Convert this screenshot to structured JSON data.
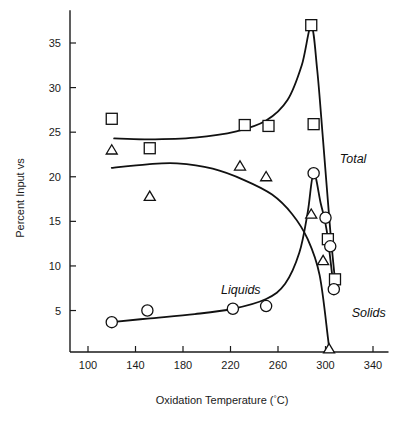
{
  "chart_data": {
    "type": "scatter",
    "title": "",
    "xlabel": "Oxidation Temperature (°C)",
    "ylabel": "Percent Input vs",
    "xlim": [
      88,
      348
    ],
    "ylim": [
      0,
      38
    ],
    "xticks": [
      100,
      140,
      180,
      220,
      260,
      300,
      340
    ],
    "yticks": [
      5,
      10,
      15,
      20,
      25,
      30,
      35
    ],
    "xtick_labels": [
      "100",
      "140",
      "180",
      "220",
      "260",
      "300",
      "340"
    ],
    "ytick_labels": [
      "5",
      "10",
      "15",
      "20",
      "25",
      "30",
      "35"
    ],
    "grid": false,
    "legend_position": "inline-annotations",
    "series": [
      {
        "name": "Total",
        "marker": "square",
        "label": "Total",
        "label_x": 312,
        "label_y": 21.5,
        "points": [
          {
            "x": 120,
            "y": 26.5
          },
          {
            "x": 152,
            "y": 23.2
          },
          {
            "x": 232,
            "y": 25.8
          },
          {
            "x": 252,
            "y": 25.7
          },
          {
            "x": 288,
            "y": 37.0
          },
          {
            "x": 290,
            "y": 25.9
          },
          {
            "x": 302,
            "y": 13.0
          },
          {
            "x": 308,
            "y": 8.5
          }
        ],
        "curve": [
          {
            "x": 122,
            "y": 24.3
          },
          {
            "x": 150,
            "y": 24.2
          },
          {
            "x": 190,
            "y": 24.4
          },
          {
            "x": 225,
            "y": 25.1
          },
          {
            "x": 250,
            "y": 26.3
          },
          {
            "x": 268,
            "y": 28.6
          },
          {
            "x": 280,
            "y": 32.5
          },
          {
            "x": 288,
            "y": 36.9
          },
          {
            "x": 293,
            "y": 32.0
          },
          {
            "x": 298,
            "y": 24.0
          },
          {
            "x": 304,
            "y": 14.0
          },
          {
            "x": 308,
            "y": 8.4
          }
        ]
      },
      {
        "name": "Liquids",
        "marker": "circle",
        "label": "Liquids",
        "label_x": 212,
        "label_y": 6.9,
        "points": [
          {
            "x": 120,
            "y": 3.7
          },
          {
            "x": 150,
            "y": 5.0
          },
          {
            "x": 222,
            "y": 5.2
          },
          {
            "x": 250,
            "y": 5.5
          },
          {
            "x": 290,
            "y": 20.4
          },
          {
            "x": 300,
            "y": 15.4
          },
          {
            "x": 304,
            "y": 12.2
          },
          {
            "x": 307,
            "y": 7.4
          }
        ],
        "curve": [
          {
            "x": 120,
            "y": 3.7
          },
          {
            "x": 150,
            "y": 4.1
          },
          {
            "x": 190,
            "y": 4.6
          },
          {
            "x": 222,
            "y": 5.2
          },
          {
            "x": 250,
            "y": 6.3
          },
          {
            "x": 266,
            "y": 8.0
          },
          {
            "x": 278,
            "y": 11.5
          },
          {
            "x": 285,
            "y": 16.0
          },
          {
            "x": 290,
            "y": 20.4
          },
          {
            "x": 296,
            "y": 17.0
          },
          {
            "x": 301,
            "y": 14.0
          },
          {
            "x": 307,
            "y": 7.4
          }
        ]
      },
      {
        "name": "Solids",
        "marker": "triangle",
        "label": "Solids",
        "label_x": 322,
        "label_y": 4.3,
        "points": [
          {
            "x": 120,
            "y": 23.0
          },
          {
            "x": 152,
            "y": 17.8
          },
          {
            "x": 228,
            "y": 21.2
          },
          {
            "x": 250,
            "y": 20.0
          },
          {
            "x": 288,
            "y": 15.8
          },
          {
            "x": 298,
            "y": 10.6
          },
          {
            "x": 303,
            "y": 0.7
          }
        ],
        "curve": [
          {
            "x": 120,
            "y": 21.0
          },
          {
            "x": 150,
            "y": 21.4
          },
          {
            "x": 175,
            "y": 21.5
          },
          {
            "x": 205,
            "y": 20.9
          },
          {
            "x": 232,
            "y": 19.6
          },
          {
            "x": 255,
            "y": 18.0
          },
          {
            "x": 272,
            "y": 15.8
          },
          {
            "x": 285,
            "y": 13.0
          },
          {
            "x": 295,
            "y": 9.0
          },
          {
            "x": 302,
            "y": 2.0
          },
          {
            "x": 303,
            "y": 0.6
          }
        ]
      }
    ]
  }
}
